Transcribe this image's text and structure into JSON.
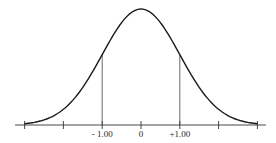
{
  "chart_data": {
    "type": "line",
    "title": "",
    "xlabel": "",
    "ylabel": "",
    "x_ticks": [
      -3,
      -2,
      -1,
      0,
      1,
      2,
      3
    ],
    "x_tick_labels": [
      "",
      "",
      "- 1.00",
      "0",
      "+1.00",
      "",
      ""
    ],
    "xlim": [
      -3.2,
      3.2
    ],
    "ylim": [
      0,
      0.4
    ],
    "grid": false,
    "legend": null,
    "series": [
      {
        "name": "normal-curve",
        "x": [
          -3.0,
          -2.5,
          -2.0,
          -1.5,
          -1.0,
          -0.5,
          0.0,
          0.5,
          1.0,
          1.5,
          2.0,
          2.5,
          3.0
        ],
        "values": [
          0.0044,
          0.0175,
          0.054,
          0.1295,
          0.242,
          0.3521,
          0.3989,
          0.3521,
          0.242,
          0.1295,
          0.054,
          0.0175,
          0.0044
        ]
      }
    ],
    "annotations": [
      {
        "type": "vertical-line",
        "x": -1.0,
        "label": "- 1.00"
      },
      {
        "type": "vertical-line",
        "x": 1.0,
        "label": "+1.00"
      }
    ],
    "colors": {
      "curve": "#1a1a1a",
      "axis": "#333333",
      "guides": "#444444"
    }
  }
}
